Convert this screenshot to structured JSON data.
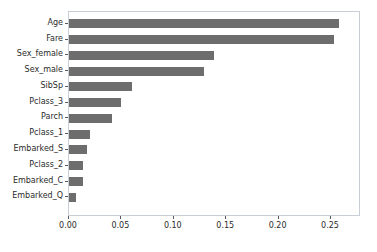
{
  "chart_data": {
    "type": "bar",
    "orientation": "horizontal",
    "title": "",
    "xlabel": "",
    "ylabel": "",
    "categories": [
      "Age",
      "Fare",
      "Sex_female",
      "Sex_male",
      "SibSp",
      "Pclass_3",
      "Parch",
      "Pclass_1",
      "Embarked_S",
      "Pclass_2",
      "Embarked_C",
      "Embarked_Q"
    ],
    "values": [
      0.258,
      0.253,
      0.138,
      0.129,
      0.06,
      0.05,
      0.041,
      0.02,
      0.017,
      0.013,
      0.013,
      0.007
    ],
    "xticks": [
      0.0,
      0.05,
      0.1,
      0.15,
      0.2,
      0.25
    ],
    "xtick_labels": [
      "0.00",
      "0.05",
      "0.10",
      "0.15",
      "0.20",
      "0.25"
    ],
    "xlim": [
      0.0,
      0.2786
    ],
    "grid": false,
    "legend": null,
    "bar_color": "#6d6d6d",
    "frame_color": "#c9cdd4",
    "background_color": "#ffffff"
  }
}
